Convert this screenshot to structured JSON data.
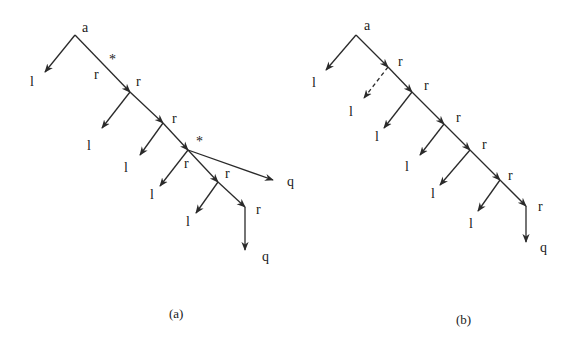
{
  "diagrams": [
    {
      "id": "a",
      "caption": "(a)",
      "root_label": "a",
      "nodes": [
        {
          "id": "root",
          "x": 75,
          "y": 35,
          "label": "a",
          "lx": 82,
          "ly": 32
        },
        {
          "id": "n1",
          "x": 130,
          "y": 92,
          "label": "r",
          "lx": 136,
          "ly": 86
        },
        {
          "id": "n2",
          "x": 163,
          "y": 123,
          "label": "r",
          "lx": 172,
          "ly": 123
        },
        {
          "id": "n3",
          "x": 188,
          "y": 150,
          "label": "r",
          "lx": 184,
          "ly": 168
        },
        {
          "id": "n4",
          "x": 218,
          "y": 182,
          "label": "r",
          "lx": 225,
          "ly": 178
        },
        {
          "id": "n5",
          "x": 245,
          "y": 207,
          "label": "r",
          "lx": 256,
          "ly": 214
        }
      ],
      "edges": [
        {
          "from": [
            75,
            35
          ],
          "to": [
            45,
            72
          ],
          "dashed": false,
          "label": "l",
          "lx": 30,
          "ly": 86
        },
        {
          "from": [
            75,
            35
          ],
          "to": [
            130,
            92
          ],
          "dashed": false
        },
        {
          "from": [
            130,
            92
          ],
          "to": [
            102,
            128
          ],
          "dashed": false,
          "label": "l",
          "lx": 87,
          "ly": 150
        },
        {
          "from": [
            130,
            92
          ],
          "to": [
            163,
            123
          ],
          "dashed": false
        },
        {
          "from": [
            163,
            123
          ],
          "to": [
            140,
            155
          ],
          "dashed": false,
          "label": "l",
          "lx": 124,
          "ly": 172
        },
        {
          "from": [
            163,
            123
          ],
          "to": [
            188,
            150
          ],
          "dashed": false
        },
        {
          "from": [
            188,
            150
          ],
          "to": [
            160,
            186
          ],
          "dashed": false,
          "label": "l",
          "lx": 150,
          "ly": 199
        },
        {
          "from": [
            188,
            150
          ],
          "to": [
            273,
            180
          ],
          "dashed": false,
          "label": "q",
          "lx": 287,
          "ly": 186
        },
        {
          "from": [
            188,
            150
          ],
          "to": [
            218,
            182
          ],
          "dashed": false
        },
        {
          "from": [
            218,
            182
          ],
          "to": [
            196,
            213
          ],
          "dashed": false,
          "label": "l",
          "lx": 186,
          "ly": 226
        },
        {
          "from": [
            218,
            182
          ],
          "to": [
            245,
            207
          ],
          "dashed": false
        },
        {
          "from": [
            245,
            207
          ],
          "to": [
            245,
            250
          ],
          "dashed": false,
          "label": "q",
          "lx": 262,
          "ly": 261
        }
      ],
      "extra_labels": [
        {
          "text": "*",
          "x": 109,
          "y": 64
        },
        {
          "text": "r",
          "x": 94,
          "y": 79
        },
        {
          "text": "*",
          "x": 196,
          "y": 146
        }
      ]
    },
    {
      "id": "b",
      "caption": "(b)",
      "root_label": "a",
      "nodes": [
        {
          "id": "root",
          "x": 356,
          "y": 35,
          "label": "a",
          "lx": 364,
          "ly": 30
        },
        {
          "id": "n1",
          "x": 388,
          "y": 67,
          "label": "r",
          "lx": 398,
          "ly": 66
        },
        {
          "id": "n2",
          "x": 412,
          "y": 92,
          "label": "r",
          "lx": 424,
          "ly": 90
        },
        {
          "id": "n3",
          "x": 444,
          "y": 124,
          "label": "r",
          "lx": 456,
          "ly": 122
        },
        {
          "id": "n4",
          "x": 470,
          "y": 150,
          "label": "r",
          "lx": 482,
          "ly": 149
        },
        {
          "id": "n5",
          "x": 500,
          "y": 180,
          "label": "r",
          "lx": 508,
          "ly": 180
        },
        {
          "id": "n6",
          "x": 526,
          "y": 206,
          "label": "r",
          "lx": 538,
          "ly": 211
        }
      ],
      "edges": [
        {
          "from": [
            356,
            35
          ],
          "to": [
            326,
            70
          ],
          "dashed": false,
          "label": "l",
          "lx": 312,
          "ly": 87
        },
        {
          "from": [
            356,
            35
          ],
          "to": [
            388,
            67
          ],
          "dashed": false
        },
        {
          "from": [
            388,
            67
          ],
          "to": [
            364,
            98
          ],
          "dashed": true,
          "label": "l",
          "lx": 349,
          "ly": 116
        },
        {
          "from": [
            388,
            67
          ],
          "to": [
            412,
            92
          ],
          "dashed": false
        },
        {
          "from": [
            412,
            92
          ],
          "to": [
            384,
            128
          ],
          "dashed": false,
          "label": "l",
          "lx": 375,
          "ly": 141
        },
        {
          "from": [
            412,
            92
          ],
          "to": [
            444,
            124
          ],
          "dashed": false
        },
        {
          "from": [
            444,
            124
          ],
          "to": [
            420,
            155
          ],
          "dashed": false,
          "label": "l",
          "lx": 405,
          "ly": 171
        },
        {
          "from": [
            444,
            124
          ],
          "to": [
            470,
            150
          ],
          "dashed": false
        },
        {
          "from": [
            470,
            150
          ],
          "to": [
            440,
            185
          ],
          "dashed": false,
          "label": "l",
          "lx": 431,
          "ly": 198
        },
        {
          "from": [
            470,
            150
          ],
          "to": [
            500,
            180
          ],
          "dashed": false
        },
        {
          "from": [
            500,
            180
          ],
          "to": [
            478,
            211
          ],
          "dashed": false,
          "label": "l",
          "lx": 469,
          "ly": 228
        },
        {
          "from": [
            500,
            180
          ],
          "to": [
            526,
            206
          ],
          "dashed": false
        },
        {
          "from": [
            526,
            206
          ],
          "to": [
            526,
            242
          ],
          "dashed": false,
          "label": "q",
          "lx": 540,
          "ly": 252
        }
      ],
      "extra_labels": []
    }
  ],
  "captions": {
    "a": {
      "text": "(a)",
      "x": 169,
      "y": 318
    },
    "b": {
      "text": "(b)",
      "x": 456,
      "y": 324
    }
  }
}
